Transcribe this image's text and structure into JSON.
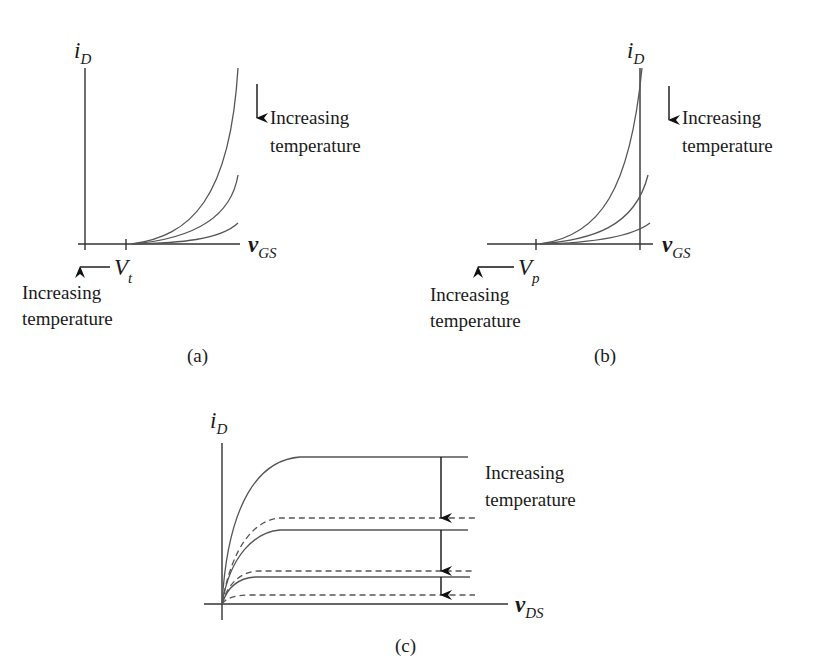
{
  "figure": {
    "panels": [
      {
        "id": "a",
        "caption": "(a)",
        "y_axis": {
          "symbol": "i",
          "subscript": "D"
        },
        "x_axis": {
          "symbol": "v",
          "subscript": "GS"
        },
        "threshold": {
          "symbol": "V",
          "subscript": "t"
        },
        "curve_annotation": {
          "line1": "Increasing",
          "line2": "temperature",
          "arrow": "down-arrow"
        },
        "threshold_annotation": {
          "line1": "Increasing",
          "line2": "temperature",
          "arrow": "left-arrow"
        },
        "curve_count": 3
      },
      {
        "id": "b",
        "caption": "(b)",
        "y_axis": {
          "symbol": "i",
          "subscript": "D"
        },
        "x_axis": {
          "symbol": "v",
          "subscript": "GS"
        },
        "threshold": {
          "symbol": "V",
          "subscript": "p"
        },
        "curve_annotation": {
          "line1": "Increasing",
          "line2": "temperature",
          "arrow": "down-arrow"
        },
        "threshold_annotation": {
          "line1": "Increasing",
          "line2": "temperature",
          "arrow": "left-arrow"
        },
        "curve_count": 3
      },
      {
        "id": "c",
        "caption": "(c)",
        "y_axis": {
          "symbol": "i",
          "subscript": "D"
        },
        "x_axis": {
          "symbol": "v",
          "subscript": "DS"
        },
        "curve_annotation": {
          "line1": "Increasing",
          "line2": "temperature",
          "arrow": "down-arrow"
        },
        "solid_curve_count": 3,
        "dashed_curve_count": 3
      }
    ]
  }
}
